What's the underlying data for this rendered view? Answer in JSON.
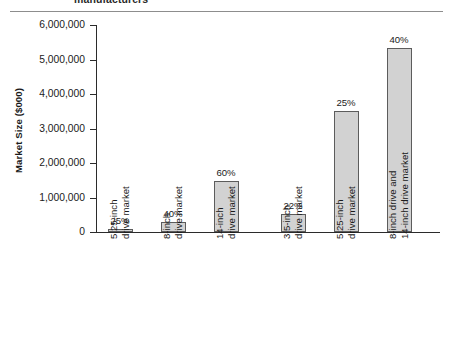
{
  "header": {
    "title_fragment": "manufacturers"
  },
  "chart_data": {
    "type": "bar",
    "title": "manufacturers",
    "xlabel": "",
    "ylabel": "Market Size ($000)",
    "ylim": [
      0,
      6000000
    ],
    "ytick_labels": [
      "6,000,000",
      "5,000,000",
      "4,000,000",
      "3,000,000",
      "2,000,000",
      "1,000,000",
      "0"
    ],
    "ytick_values": [
      6000000,
      5000000,
      4000000,
      3000000,
      2000000,
      1000000,
      0
    ],
    "grid": false,
    "legend": "none",
    "categories": [
      "5.25-inch drive market",
      "8-inch drive market",
      "14-inch drive market",
      "3.5-inch drive market",
      "5.25-inch drive market",
      "8-inch drive and 14-inch drive market"
    ],
    "category_lines": [
      [
        "5.25-inch",
        "drive market"
      ],
      [
        "8-inch",
        "drive market"
      ],
      [
        "14-inch",
        "drive market"
      ],
      [
        "3.5-inch",
        "drive market"
      ],
      [
        "5.25-inch",
        "drive market"
      ],
      [
        "8-inch drive and",
        "14-inch drive market"
      ]
    ],
    "values": [
      70000,
      290000,
      1480000,
      520000,
      3500000,
      5330000
    ],
    "data_labels": [
      "25%",
      "40%",
      "60%",
      "22%",
      "25%",
      "40%"
    ],
    "bar_fill_color": "#d2d2d2",
    "bar_border_color": "#5c5c5c",
    "axis_color": "#2b2b2b",
    "group_gap_after_index": 2
  }
}
